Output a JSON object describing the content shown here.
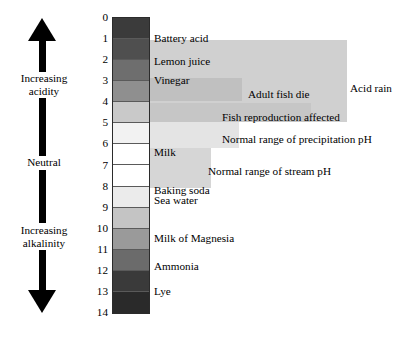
{
  "figure": {
    "type": "ph-scale-diagram",
    "background": "#ffffff",
    "width": 402,
    "height": 337
  },
  "axis": {
    "name": "pH",
    "min": 0,
    "max": 14,
    "ticks": [
      "0",
      "1",
      "2",
      "3",
      "4",
      "5",
      "6",
      "7",
      "8",
      "9",
      "10",
      "11",
      "12",
      "13",
      "14"
    ],
    "orientation": "vertical-descending"
  },
  "gradient_arrow": {
    "top_label": "Increasing\nacidity",
    "top_label_line1": "Increasing",
    "top_label_line2": "acidity",
    "middle_label": "Neutral",
    "bottom_label_line1": "Increasing",
    "bottom_label_line2": "alkalinity",
    "arrow_color": "#000000"
  },
  "scale_colors": [
    {
      "ph": 0,
      "hex": "#3b3b3b"
    },
    {
      "ph": 1,
      "hex": "#4f4f4f"
    },
    {
      "ph": 2,
      "hex": "#6e6e6e"
    },
    {
      "ph": 3,
      "hex": "#8f8f8f"
    },
    {
      "ph": 4,
      "hex": "#c9c9c9"
    },
    {
      "ph": 5,
      "hex": "#f2f2f2"
    },
    {
      "ph": 6,
      "hex": "#ffffff"
    },
    {
      "ph": 7,
      "hex": "#ffffff"
    },
    {
      "ph": 8,
      "hex": "#ebebeb"
    },
    {
      "ph": 9,
      "hex": "#c4c4c4"
    },
    {
      "ph": 10,
      "hex": "#9a9a9a"
    },
    {
      "ph": 11,
      "hex": "#6b6b6b"
    },
    {
      "ph": 12,
      "hex": "#3a3a3a"
    },
    {
      "ph": 13,
      "hex": "#2a2a2a"
    },
    {
      "ph": 14,
      "hex": "#1a1a1a"
    }
  ],
  "substances": [
    {
      "label": "Battery acid",
      "ph": 1.0
    },
    {
      "label": "Lemon juice",
      "ph": 2.1
    },
    {
      "label": "Vinegar",
      "ph": 3.0
    },
    {
      "label": "Milk",
      "ph": 6.4
    },
    {
      "label": "Baking soda",
      "ph": 8.2
    },
    {
      "label": "Sea water",
      "ph": 8.7
    },
    {
      "label": "Milk of Magnesia",
      "ph": 10.5
    },
    {
      "label": "Ammonia",
      "ph": 11.8
    },
    {
      "label": "Lye",
      "ph": 13.0
    }
  ],
  "bands": [
    {
      "label": "Acid rain",
      "ph_start": 1.1,
      "ph_end": 5.0,
      "fill": "#d0d0d0",
      "label_position": "outside-right"
    },
    {
      "label": "Adult fish die",
      "ph_start": 2.9,
      "ph_end": 4.0,
      "fill": "#c0c0c0",
      "label_position": "outside-right"
    },
    {
      "label": "Fish reproduction affected",
      "ph_start": 4.1,
      "ph_end": 5.0,
      "fill": "#c6c6c6",
      "label_position": "inside"
    },
    {
      "label": "Normal range of precipitation pH",
      "ph_start": 5.0,
      "ph_end": 6.2,
      "fill": "#e4e4e4",
      "label_position": "inside"
    },
    {
      "label": "Normal range of stream pH",
      "ph_start": 6.2,
      "ph_end": 8.1,
      "fill": "#d6d6d6",
      "label_position": "inside"
    }
  ]
}
